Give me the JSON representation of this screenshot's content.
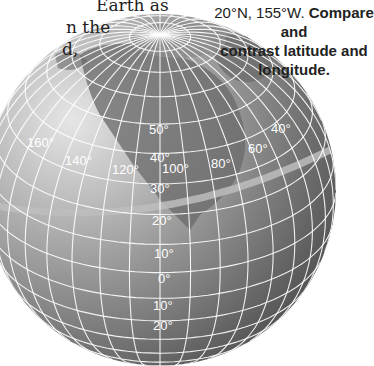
{
  "caption_left": {
    "lines": [
      "Earth as",
      "n the",
      "d,"
    ]
  },
  "caption_right": {
    "coordinate_text": "20°N, 155°W.",
    "question_part1": "Compare and",
    "question_part2": "contrast latitude and",
    "question_part3": "longitude."
  },
  "globe": {
    "longitude_labels": [
      {
        "text": "160°"
      },
      {
        "text": "140°"
      },
      {
        "text": "120°"
      },
      {
        "text": "100°"
      },
      {
        "text": "80°"
      },
      {
        "text": "60°"
      },
      {
        "text": "40°"
      }
    ],
    "latitude_labels": [
      {
        "text": "50°"
      },
      {
        "text": "40°"
      },
      {
        "text": "30°"
      },
      {
        "text": "20°"
      },
      {
        "text": "10°"
      },
      {
        "text": "0°"
      },
      {
        "text": "10°"
      },
      {
        "text": "20°"
      }
    ],
    "highlighted_parallel": "20°",
    "colors": {
      "ocean_light": "#c9c9c9",
      "ocean_dark": "#555555",
      "land": "#707070",
      "grid": "#ffffff",
      "highlight_band": "#bdbdbd"
    }
  }
}
